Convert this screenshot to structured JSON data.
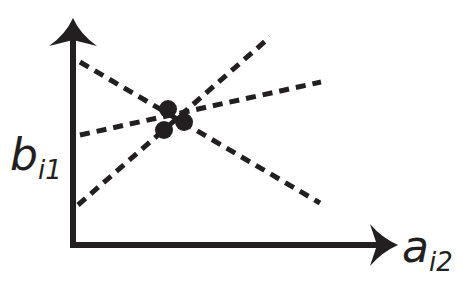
{
  "diagram": {
    "type": "scatter-with-candidate-lines",
    "colors": {
      "ink": "#231f20",
      "background": "#ffffff"
    },
    "axes": {
      "x": {
        "label_main": "a",
        "label_sub": "i2",
        "origin": [
          73,
          245
        ],
        "end": [
          396,
          245
        ]
      },
      "y": {
        "label_main": "b",
        "label_sub": "i1",
        "origin": [
          73,
          245
        ],
        "end": [
          73,
          20
        ]
      }
    },
    "lines": [
      {
        "name": "descending-line",
        "from": [
          80,
          62
        ],
        "to": [
          320,
          203
        ],
        "style": "dashed"
      },
      {
        "name": "shallow-ascending-line",
        "from": [
          80,
          135
        ],
        "to": [
          321,
          82
        ],
        "style": "dashed"
      },
      {
        "name": "steep-ascending-line",
        "from": [
          78,
          205
        ],
        "to": [
          270,
          37
        ],
        "style": "dashed"
      }
    ],
    "points": [
      {
        "cx": 168,
        "cy": 109,
        "r": 9
      },
      {
        "cx": 184,
        "cy": 122,
        "r": 9
      },
      {
        "cx": 164,
        "cy": 130,
        "r": 9
      }
    ]
  }
}
